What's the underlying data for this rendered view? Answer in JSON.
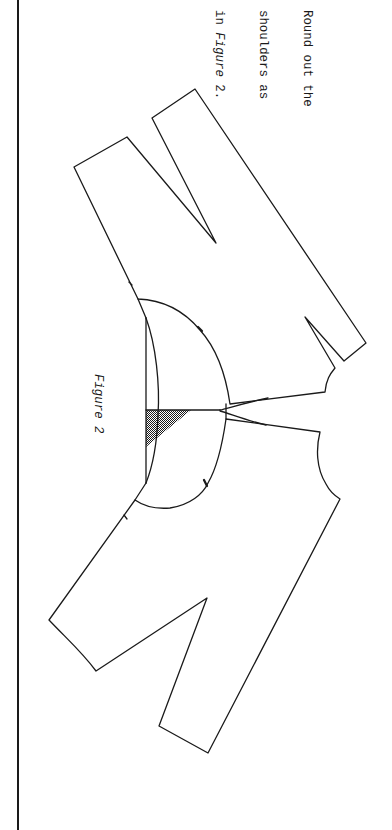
{
  "instruction": {
    "lines": [
      {
        "prefix": "Round out the",
        "emphasis": ""
      },
      {
        "prefix": "shoulders as",
        "emphasis": ""
      },
      {
        "prefix": "in ",
        "emphasis": "Figure",
        "suffix": " 2."
      }
    ]
  },
  "figure": {
    "label": "Figure 2",
    "pieces": [
      {
        "name": "upper-bodice-piece",
        "notches": 2,
        "darts": 2
      },
      {
        "name": "lower-bodice-piece",
        "notches": 2,
        "darts": 1
      }
    ],
    "shaded_area": "shoulder-overlap-hatching"
  },
  "colors": {
    "ink": "#1a1a1a",
    "paper": "#ffffff"
  }
}
